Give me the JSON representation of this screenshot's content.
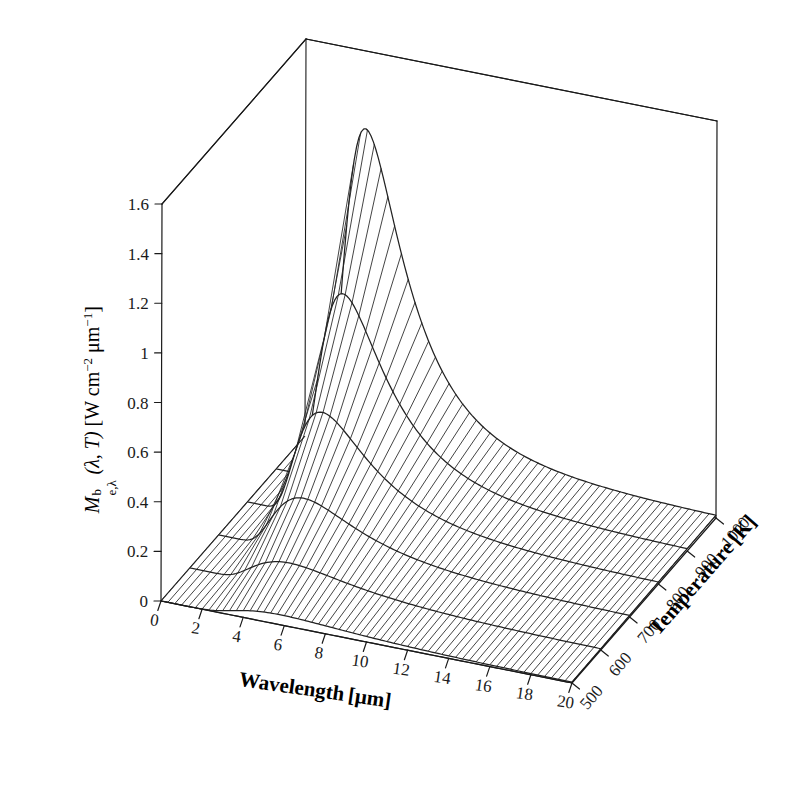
{
  "chart_data": {
    "type": "line",
    "plot_kind": "3d-mesh-surface",
    "title": "",
    "xlabel": "Wavelength [μm]",
    "ylabel": "Temperature [K]",
    "zlabel": "M_{e,λ}^{b}(λ, T) [W cm^-2 μm^-1]",
    "xlim": [
      0,
      20
    ],
    "ylim": [
      500,
      1000
    ],
    "zlim": [
      0,
      1.6
    ],
    "xticks": [
      "0",
      "2",
      "4",
      "6",
      "8",
      "10",
      "12",
      "14",
      "16",
      "18",
      "20"
    ],
    "xtick_values": [
      0,
      2,
      4,
      6,
      8,
      10,
      12,
      14,
      16,
      18,
      20
    ],
    "yticks": [
      "500",
      "600",
      "700",
      "800",
      "900",
      "1000"
    ],
    "ytick_values": [
      500,
      600,
      700,
      800,
      900,
      1000
    ],
    "zticks": [
      "0",
      "0.2",
      "0.4",
      "0.6",
      "0.8",
      "1",
      "1.2",
      "1.4",
      "1.6"
    ],
    "ztick_values": [
      0,
      0.2,
      0.4,
      0.6,
      0.8,
      1.0,
      1.2,
      1.4,
      1.6
    ],
    "grid": false,
    "legend": "none",
    "series_label_prefix": "T =",
    "series": [
      {
        "name": "500 K",
        "temperature": 500,
        "x": [
          0.5,
          1,
          1.5,
          2,
          2.5,
          3,
          3.5,
          4,
          4.5,
          5,
          5.5,
          6,
          6.5,
          7,
          7.5,
          8,
          8.5,
          9,
          9.5,
          10,
          11,
          12,
          13,
          14,
          15,
          16,
          17,
          18,
          19,
          20
        ],
        "values": [
          0.0,
          0.0,
          0.0003,
          0.0048,
          0.02,
          0.0453,
          0.0749,
          0.1027,
          0.1252,
          0.1413,
          0.1513,
          0.1561,
          0.157,
          0.155,
          0.1509,
          0.1454,
          0.1391,
          0.1323,
          0.1253,
          0.1182,
          0.1046,
          0.0922,
          0.0812,
          0.0716,
          0.0633,
          0.0561,
          0.0498,
          0.0444,
          0.0397,
          0.0356
        ]
      },
      {
        "name": "600 K",
        "temperature": 600,
        "x": [
          0.5,
          1,
          1.5,
          2,
          2.5,
          3,
          3.5,
          4,
          4.5,
          5,
          5.5,
          6,
          6.5,
          7,
          7.5,
          8,
          8.5,
          9,
          9.5,
          10,
          11,
          12,
          13,
          14,
          15,
          16,
          17,
          18,
          19,
          20
        ],
        "values": [
          0.0,
          0.0001,
          0.0057,
          0.0363,
          0.094,
          0.1588,
          0.2129,
          0.2493,
          0.2679,
          0.272,
          0.2657,
          0.2527,
          0.2359,
          0.2175,
          0.1988,
          0.1806,
          0.1634,
          0.1475,
          0.133,
          0.1198,
          0.0975,
          0.0797,
          0.0656,
          0.0545,
          0.0456,
          0.0385,
          0.0328,
          0.0281,
          0.0243,
          0.0211
        ]
      },
      {
        "name": "700 K",
        "temperature": 700,
        "x": [
          0.5,
          1,
          1.5,
          2,
          2.5,
          3,
          3.5,
          4,
          4.5,
          5,
          5.5,
          6,
          6.5,
          7,
          7.5,
          8,
          8.5,
          9,
          9.5,
          10,
          11,
          12,
          13,
          14,
          15,
          16,
          17,
          18,
          19,
          20
        ],
        "values": [
          0.0,
          0.0012,
          0.0368,
          0.1406,
          0.2697,
          0.3775,
          0.4459,
          0.4763,
          0.478,
          0.4605,
          0.4317,
          0.3974,
          0.3614,
          0.3262,
          0.293,
          0.2625,
          0.2347,
          0.2097,
          0.1874,
          0.1675,
          0.1343,
          0.1084,
          0.0882,
          0.0725,
          0.06,
          0.0502,
          0.0423,
          0.0359,
          0.0307,
          0.0265
        ]
      },
      {
        "name": "800 K",
        "temperature": 800,
        "x": [
          0.5,
          1,
          1.5,
          2,
          2.5,
          3,
          3.5,
          4,
          4.5,
          5,
          5.5,
          6,
          6.5,
          7,
          7.5,
          8,
          8.5,
          9,
          9.5,
          10,
          11,
          12,
          13,
          14,
          15,
          16,
          17,
          18,
          19,
          20
        ],
        "values": [
          0.0,
          0.0091,
          0.1459,
          0.3849,
          0.599,
          0.732,
          0.7886,
          0.7921,
          0.7624,
          0.7144,
          0.6582,
          0.6001,
          0.5438,
          0.4914,
          0.4437,
          0.4007,
          0.3622,
          0.3279,
          0.2973,
          0.2701,
          0.2242,
          0.1875,
          0.1581,
          0.1343,
          0.1149,
          0.0989,
          0.0856,
          0.0745,
          0.0651,
          0.0572
        ]
      },
      {
        "name": "900 K",
        "temperature": 900,
        "x": [
          0.5,
          1,
          1.5,
          2,
          2.5,
          3,
          3.5,
          4,
          4.5,
          5,
          5.5,
          6,
          6.5,
          7,
          7.5,
          8,
          8.5,
          9,
          9.5,
          10,
          11,
          12,
          13,
          14,
          15,
          16,
          17,
          18,
          19,
          20
        ],
        "values": [
          0.0001,
          0.0449,
          0.4264,
          0.8696,
          1.152,
          1.25,
          1.2437,
          1.1828,
          1.1003,
          1.012,
          0.9262,
          0.8464,
          0.7736,
          0.7081,
          0.6494,
          0.5971,
          0.5504,
          0.5087,
          0.4715,
          0.4382,
          0.381,
          0.3345,
          0.2961,
          0.2641,
          0.2371,
          0.2142,
          0.1945,
          0.1775,
          0.1627,
          0.1497
        ]
      },
      {
        "name": "1000 K",
        "temperature": 1000,
        "x": [
          0.5,
          1,
          1.5,
          2,
          2.5,
          3,
          3.5,
          4,
          4.5,
          5,
          5.5,
          6,
          6.5,
          7,
          7.5,
          8,
          8.5,
          9,
          9.5,
          10,
          11,
          12,
          13,
          14,
          15,
          16,
          17,
          18,
          19,
          20
        ],
        "values": [
          0.0009,
          0.164,
          0.9778,
          1.64,
          1.896,
          1.882,
          1.757,
          1.599,
          1.446,
          1.309,
          1.189,
          1.084,
          0.993,
          0.913,
          0.843,
          0.781,
          0.727,
          0.678,
          0.635,
          0.596,
          0.529,
          0.474,
          0.428,
          0.389,
          0.355,
          0.326,
          0.301,
          0.278,
          0.258,
          0.241
        ]
      }
    ],
    "annotation": "Planck blackbody spectral exitance surface; peak exceeds the 1.6 axis limit at T = 1000 K",
    "mesh_lines_wavelength": 60,
    "mesh_lines_temperature": 6
  },
  "axes": {
    "x": {
      "label_main": "Wavelength",
      "label_unit": "[μm]"
    },
    "y": {
      "label_main": "Temperature",
      "label_unit": "[K]"
    },
    "z": {
      "symbol_M": "M",
      "sup_b": "b",
      "sub_el": "e,λ",
      "args": "(λ, T)",
      "unit_open": "[W cm",
      "unit_sup1": "−2",
      "unit_mid": " μm",
      "unit_sup2": "−1",
      "unit_close": "]"
    }
  },
  "style": {
    "line_color": "#1a1a1a",
    "mesh_color": "#222222",
    "background": "#ffffff",
    "box_color": "#1a1a1a"
  }
}
